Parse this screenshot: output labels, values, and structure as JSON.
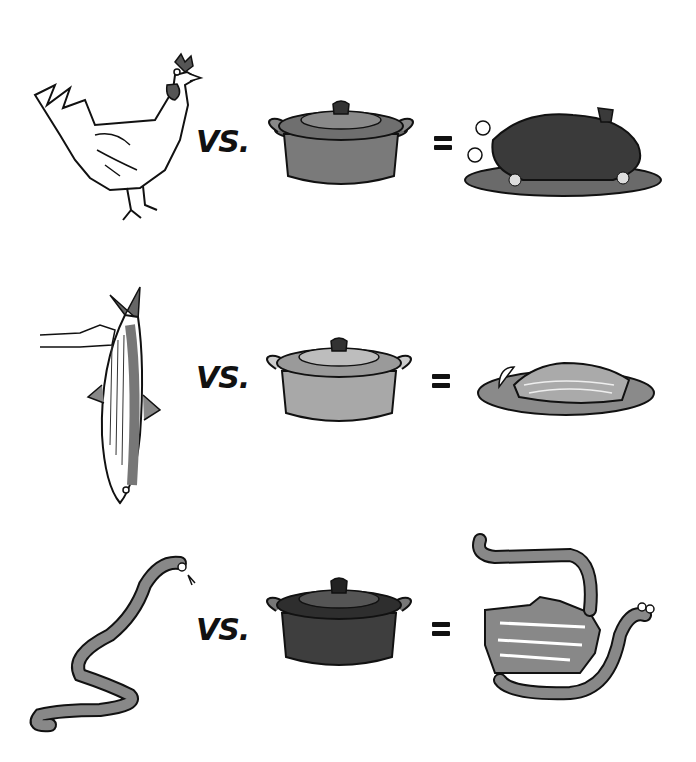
{
  "illustration": {
    "rows": [
      {
        "subject": "chicken",
        "operator": "VS.",
        "tool": "dutch-oven",
        "equals": "=",
        "result": "roast-chicken-on-platter",
        "pot_shade": "#7a7a7a"
      },
      {
        "subject": "striped-bass-held-by-hand",
        "operator": "VS.",
        "tool": "dutch-oven",
        "equals": "=",
        "result": "salmon-fillet-on-plate",
        "pot_shade": "#a8a8a8"
      },
      {
        "subject": "snake",
        "operator": "VS.",
        "tool": "dutch-oven",
        "equals": "=",
        "result": "snake-coiled-around-pot-shape",
        "pot_shade": "#3e3e3e"
      }
    ],
    "pot_lid_text": "LE CREUSET"
  }
}
